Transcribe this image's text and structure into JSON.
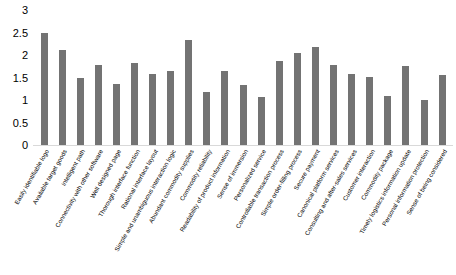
{
  "chart_data": {
    "type": "bar",
    "title": "",
    "subtitle": "",
    "xlabel": "",
    "ylabel": "",
    "ylim": [
      0,
      3
    ],
    "ytick_labels": [
      "3",
      "2.5",
      "2",
      "1.5",
      "1",
      "0.5",
      "0"
    ],
    "ytick_values": [
      3,
      2.5,
      2,
      1.5,
      1,
      0.5,
      0
    ],
    "grid": false,
    "legend": null,
    "bar_color": "#737373",
    "categories": [
      "Easily identifiable logo",
      "Available target goods",
      "Intelligent path",
      "Connectivity with other software",
      "Well designed page",
      "Thorough interface function",
      "Rational interface layout",
      "Simple and unambiguous interaction logic",
      "Abundant commodity supplies",
      "Commodity reliability",
      "Readability of product information",
      "Sense of immersion",
      "Personalized service",
      "Controllable transaction process",
      "Simple order-filling process",
      "Secure payment",
      "Canonical platform services",
      "Consulting and after-sales services",
      "Customer interaction",
      "Commodity package",
      "Timely logistics information update",
      "Personal information protection",
      "Sense of being considered"
    ],
    "values": [
      2.5,
      2.12,
      1.5,
      1.78,
      1.35,
      1.82,
      1.57,
      1.64,
      2.34,
      1.17,
      1.64,
      1.34,
      1.06,
      1.87,
      2.05,
      2.18,
      1.78,
      1.57,
      1.51,
      1.1,
      1.76,
      1.0,
      1.56
    ]
  }
}
